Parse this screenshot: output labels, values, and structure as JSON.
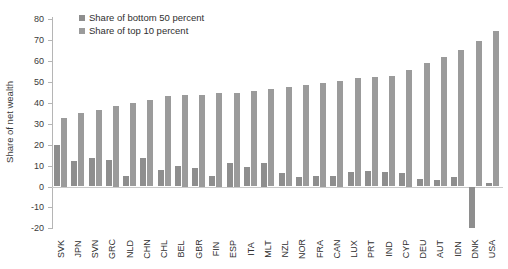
{
  "figure": {
    "ylabel": "Share of net wealth",
    "axis_color": "#b5b5b5",
    "zero_line_color": "#c9c9c9",
    "text_color": "#2f2f2f"
  },
  "chart_data": {
    "type": "bar",
    "title": "",
    "xlabel": "",
    "ylabel": "Share of net wealth",
    "ylim": [
      -20,
      80
    ],
    "yticks": [
      80,
      70,
      60,
      50,
      40,
      30,
      20,
      10,
      0,
      -10,
      -20
    ],
    "grid": false,
    "legend_position": "top-left-inside",
    "categories": [
      "SVK",
      "JPN",
      "SVN",
      "GRC",
      "NLD",
      "CHN",
      "CHL",
      "BEL",
      "GBR",
      "FIN",
      "ESP",
      "ITA",
      "MLT",
      "NZL",
      "NOR",
      "FRA",
      "CAN",
      "LUX",
      "PRT",
      "IND",
      "CYP",
      "DEU",
      "AUT",
      "IDN",
      "DNK",
      "USA"
    ],
    "series": [
      {
        "name": "Share of bottom 50 percent",
        "color": "#8e8e8e",
        "values": [
          20,
          12,
          13.5,
          12.5,
          5,
          13.5,
          8,
          10,
          9,
          5,
          11.5,
          9.5,
          11.5,
          6.5,
          4.5,
          5,
          5,
          7,
          7.5,
          7,
          6.5,
          3.5,
          3,
          4.5,
          -20,
          1.5
        ]
      },
      {
        "name": "Share of top 10 percent",
        "color": "#9b9b9b",
        "values": [
          33,
          35,
          36.5,
          38.5,
          40,
          41.5,
          43.5,
          44,
          44,
          45,
          45,
          45.5,
          46.5,
          47.5,
          48.5,
          49.5,
          50.5,
          52,
          52.5,
          53,
          56,
          59,
          62,
          65.5,
          69.5,
          74.5
        ]
      }
    ]
  }
}
